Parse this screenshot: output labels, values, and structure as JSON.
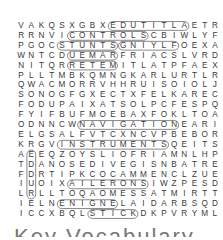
{
  "puzzle": {
    "type": "word-search",
    "rows": [
      "VAKQSXGBXEDUTITLAETR",
      "RRNVICONTROLSCBIWLYF",
      "PGOCSTUNTSGNIYLFOEXA",
      "WNTCDUEMARFRIACSLVRD",
      "NITQRRETEMITLATPFAEX",
      "PLLTMBKQMNGKARLURTLR",
      "QWACMORRVHHRUISOIOLJ",
      "SONOGFGXECTXFELKAREC",
      "FODUPAIXATSOLPCFESPQ",
      "FYIFBUFMOEBAXFOKLTOA",
      "ODNNCWNAVIGATIONEARI",
      "ELGSALFVTCXNCVPBEBOR",
      "KRGVINSTRUMENTSQEITS",
      "AEEQZOYSLIOFRIAMNLHP",
      "TDANOSEDIVEGISNBATRE",
      "FDRTIPKCOCAMMENCLZUE",
      "IUOIXAILERONSIWZPESD",
      "LRLLTOQAOMESSATMIRTT",
      "IELNENIGNELAIDARBSQD",
      "ICCXBQLSTICKDKPVRYML"
    ],
    "found_words": [
      {
        "word": "ALTITUDE",
        "row": 0,
        "col": 16,
        "dir": "W",
        "len": 8
      },
      {
        "word": "CONTROLS",
        "row": 1,
        "col": 5,
        "dir": "E",
        "len": 8
      },
      {
        "word": "STUNTS",
        "row": 2,
        "col": 4,
        "dir": "E",
        "len": 6
      },
      {
        "word": "FLYING",
        "row": 2,
        "col": 15,
        "dir": "W",
        "len": 6
      },
      {
        "word": "RADAR",
        "row": 3,
        "col": 9,
        "dir": "W",
        "len": 5
      },
      {
        "word": "METER",
        "row": 4,
        "col": 9,
        "dir": "W",
        "len": 5
      },
      {
        "word": "INSTRUMENTS",
        "row": 12,
        "col": 4,
        "dir": "E",
        "len": 11
      },
      {
        "word": "NAVIGATION",
        "row": 10,
        "col": 6,
        "dir": "E",
        "len": 10
      },
      {
        "word": "ENGINE",
        "row": 18,
        "col": 9,
        "dir": "W",
        "len": 6
      },
      {
        "word": "STICK",
        "row": 19,
        "col": 7,
        "dir": "E",
        "len": 5
      },
      {
        "word": "AILERONS",
        "row": 16,
        "col": 5,
        "dir": "E",
        "len": 8
      },
      {
        "word": "RUDDER",
        "row": 17,
        "col": 1,
        "dir": "N",
        "len": 5
      },
      {
        "word": "PILOT",
        "row": 0,
        "col": 0,
        "dir": "none",
        "len": 0
      }
    ]
  },
  "footer": {
    "partial_title": "Key Vocabulary"
  }
}
